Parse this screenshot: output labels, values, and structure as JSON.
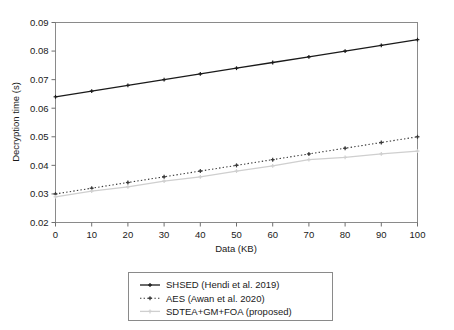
{
  "chart_data": {
    "type": "line",
    "title": "",
    "xlabel": "Data (KB)",
    "ylabel": "Decryption time (s)",
    "x": [
      0,
      10,
      20,
      30,
      40,
      50,
      60,
      70,
      80,
      90,
      100
    ],
    "xlim": [
      0,
      100
    ],
    "ylim": [
      0.02,
      0.09
    ],
    "xticks": [
      "0",
      "10",
      "20",
      "30",
      "40",
      "50",
      "60",
      "70",
      "80",
      "90",
      "100"
    ],
    "yticks": [
      "0.02",
      "0.03",
      "0.04",
      "0.05",
      "0.06",
      "0.07",
      "0.08",
      "0.09"
    ],
    "grid": false,
    "legend_position": "below-center",
    "series": [
      {
        "name": "SHSED (Hendi et al. 2019)",
        "values": [
          0.064,
          0.066,
          0.068,
          0.07,
          0.072,
          0.074,
          0.076,
          0.078,
          0.08,
          0.082,
          0.084
        ],
        "color": "#1a1a1a",
        "style": "solid",
        "marker": "plus"
      },
      {
        "name": "AES (Awan et al. 2020)",
        "values": [
          0.03,
          0.032,
          0.034,
          0.036,
          0.038,
          0.04,
          0.042,
          0.044,
          0.046,
          0.048,
          0.05
        ],
        "color": "#3a3a3a",
        "style": "dotted",
        "marker": "plus"
      },
      {
        "name": "SDTEA+GM+FOA (proposed)",
        "values": [
          0.029,
          0.031,
          0.0325,
          0.0345,
          0.036,
          0.038,
          0.0398,
          0.042,
          0.0428,
          0.044,
          0.045
        ],
        "color": "#cfcfcf",
        "style": "solid",
        "marker": "plus"
      }
    ]
  },
  "axes": {
    "x_title": "Data (KB)",
    "y_title": "Decryption time (s)"
  },
  "legend": {
    "entries": [
      {
        "label": "SHSED (Hendi et al. 2019)"
      },
      {
        "label": "AES (Awan et al. 2020)"
      },
      {
        "label": "SDTEA+GM+FOA (proposed)"
      }
    ]
  }
}
